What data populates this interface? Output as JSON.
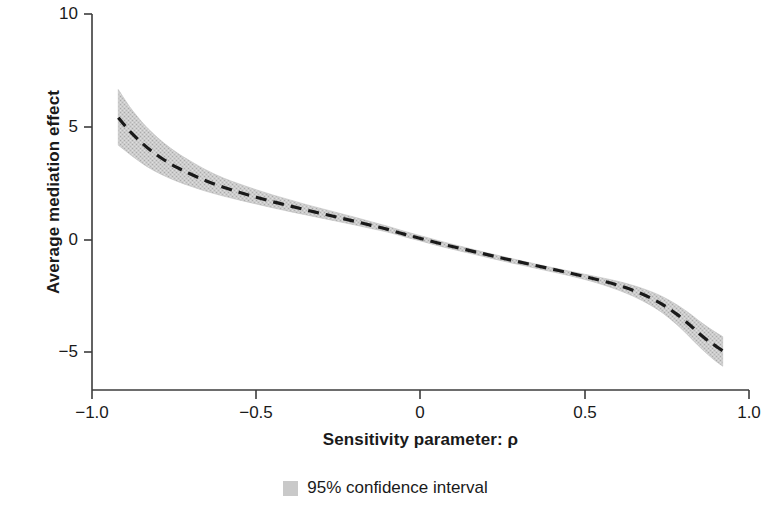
{
  "chart_data": {
    "type": "line",
    "title": "",
    "xlabel": "Sensitivity parameter: ρ",
    "ylabel": "Average mediation effect",
    "xlim": [
      -1.0,
      1.0
    ],
    "ylim": [
      -5.0,
      10.0
    ],
    "xticks": [
      -1.0,
      -0.5,
      0,
      0.5,
      1.0
    ],
    "xtick_labels": [
      "−1.0",
      "−0.5",
      "0",
      "0.5",
      "1.0"
    ],
    "yticks": [
      10,
      5,
      0,
      -5
    ],
    "ytick_labels": [
      "10",
      "5",
      "0",
      "−5"
    ],
    "grid": false,
    "legend_position": "below-axes-center",
    "legend": [
      {
        "label": "95% confidence interval",
        "marker": "filled-square",
        "color": "#c9c9c9"
      }
    ],
    "series": [
      {
        "name": "Average mediation effect",
        "style": "dashed",
        "color": "#1a1a1a",
        "x": [
          -0.92,
          -0.9,
          -0.88,
          -0.85,
          -0.82,
          -0.78,
          -0.74,
          -0.7,
          -0.65,
          -0.6,
          -0.55,
          -0.5,
          -0.45,
          -0.4,
          -0.35,
          -0.3,
          -0.25,
          -0.2,
          -0.15,
          -0.1,
          -0.05,
          0.0,
          0.05,
          0.1,
          0.15,
          0.2,
          0.25,
          0.3,
          0.35,
          0.4,
          0.45,
          0.5,
          0.55,
          0.6,
          0.65,
          0.7,
          0.74,
          0.78,
          0.82,
          0.85,
          0.88,
          0.9,
          0.92
        ],
        "y": [
          5.4,
          5.05,
          4.72,
          4.3,
          3.93,
          3.52,
          3.18,
          2.9,
          2.58,
          2.31,
          2.08,
          1.87,
          1.67,
          1.49,
          1.31,
          1.14,
          0.97,
          0.8,
          0.62,
          0.44,
          0.23,
          0.04,
          -0.15,
          -0.33,
          -0.5,
          -0.67,
          -0.84,
          -1.0,
          -1.16,
          -1.32,
          -1.48,
          -1.65,
          -1.83,
          -2.03,
          -2.28,
          -2.6,
          -2.92,
          -3.32,
          -3.8,
          -4.2,
          -4.55,
          -4.75,
          -4.95
        ]
      }
    ],
    "confidence_band": {
      "name": "95% confidence interval",
      "color": "#c9c9c9",
      "x": [
        -0.92,
        -0.9,
        -0.88,
        -0.85,
        -0.82,
        -0.78,
        -0.74,
        -0.7,
        -0.65,
        -0.6,
        -0.55,
        -0.5,
        -0.45,
        -0.4,
        -0.35,
        -0.3,
        -0.25,
        -0.2,
        -0.15,
        -0.1,
        -0.05,
        0.0,
        0.05,
        0.1,
        0.15,
        0.2,
        0.25,
        0.3,
        0.35,
        0.4,
        0.45,
        0.5,
        0.55,
        0.6,
        0.65,
        0.7,
        0.74,
        0.78,
        0.82,
        0.85,
        0.88,
        0.9,
        0.92
      ],
      "upper": [
        6.65,
        6.2,
        5.78,
        5.24,
        4.78,
        4.26,
        3.83,
        3.47,
        3.06,
        2.72,
        2.45,
        2.2,
        1.97,
        1.76,
        1.55,
        1.36,
        1.17,
        0.98,
        0.78,
        0.58,
        0.36,
        0.16,
        -0.04,
        -0.23,
        -0.41,
        -0.59,
        -0.76,
        -0.93,
        -1.09,
        -1.25,
        -1.4,
        -1.55,
        -1.7,
        -1.86,
        -2.06,
        -2.31,
        -2.57,
        -2.9,
        -3.3,
        -3.64,
        -3.95,
        -4.14,
        -4.32
      ],
      "lower": [
        4.18,
        3.95,
        3.72,
        3.4,
        3.12,
        2.82,
        2.57,
        2.36,
        2.12,
        1.92,
        1.74,
        1.57,
        1.4,
        1.24,
        1.09,
        0.94,
        0.79,
        0.64,
        0.48,
        0.32,
        0.12,
        -0.07,
        -0.27,
        -0.45,
        -0.62,
        -0.79,
        -0.96,
        -1.12,
        -1.28,
        -1.44,
        -1.6,
        -1.78,
        -1.99,
        -2.24,
        -2.54,
        -2.92,
        -3.3,
        -3.78,
        -4.34,
        -4.78,
        -5.18,
        -5.42,
        -5.63
      ]
    },
    "colors": {
      "line": "#1a1a1a",
      "band": "#c9c9c9",
      "axis": "#3c3c3c",
      "text": "#1a1a1a",
      "background": "#ffffff"
    }
  },
  "axis_titles": {
    "x": "Sensitivity parameter: ρ",
    "y": "Average mediation effect"
  },
  "legend": {
    "ci_label": "95% confidence interval"
  },
  "ticks": {
    "x": [
      "−1.0",
      "−0.5",
      "0",
      "0.5",
      "1.0"
    ],
    "y": [
      "10",
      "5",
      "0",
      "−5"
    ]
  }
}
